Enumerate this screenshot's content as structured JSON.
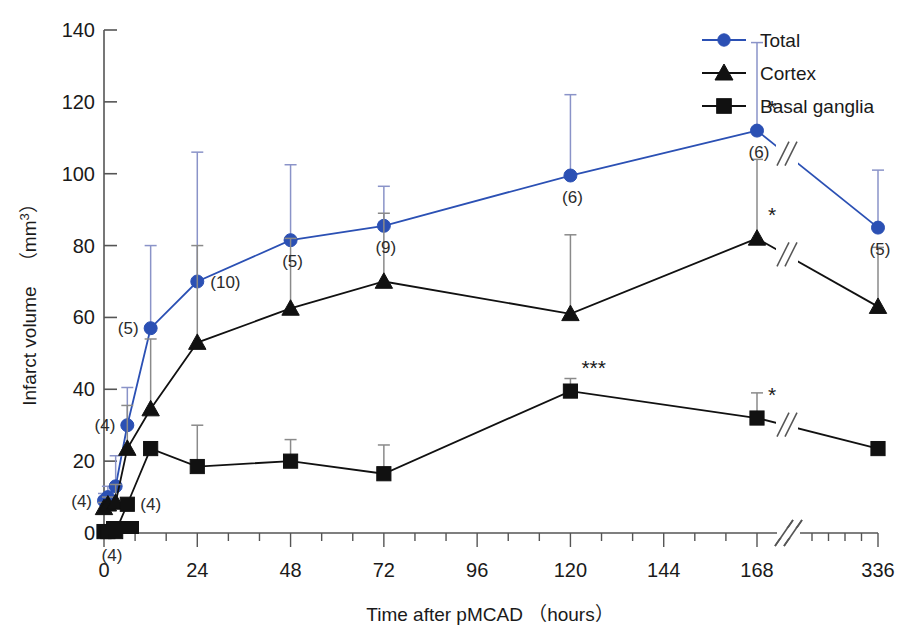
{
  "chart_data": {
    "type": "line",
    "title": "",
    "xlabel": "Time after pMCAD （hours）",
    "ylabel": "Infarct volume （mm3）",
    "ylabel_text": "Infarct volume",
    "ylabel_unit_prefix": "（mm",
    "ylabel_unit_sup": "3",
    "ylabel_unit_suffix": "）",
    "xlim": [
      0,
      336
    ],
    "ylim": [
      0,
      140
    ],
    "grid": false,
    "axis_break_x": true,
    "axis_break_between": [
      180,
      300
    ],
    "legend_position": "top-right",
    "x_ticks_major": [
      0,
      24,
      48,
      72,
      96,
      120,
      144,
      168,
      336
    ],
    "x_tick_labels": [
      "0",
      "24",
      "48",
      "72",
      "96",
      "120",
      "144",
      "168",
      "336"
    ],
    "x_ticks_minor": [
      8,
      16,
      32,
      40,
      56,
      64,
      80,
      88,
      104,
      112,
      128,
      136,
      152,
      160,
      312,
      288,
      264,
      240
    ],
    "y_ticks": [
      0,
      20,
      40,
      60,
      80,
      100,
      120,
      140
    ],
    "y_tick_labels": [
      "0",
      "20",
      "40",
      "60",
      "80",
      "100",
      "120",
      "140"
    ],
    "x": [
      0,
      1,
      3,
      6,
      12,
      24,
      48,
      72,
      120,
      168,
      336
    ],
    "series": [
      {
        "name": "Total",
        "color": "#2b50b4",
        "marker": "circle",
        "values": [
          9.0,
          10.0,
          13.0,
          30.0,
          57.0,
          70.0,
          81.5,
          85.5,
          99.5,
          112.0,
          85.0
        ],
        "err_up": [
          2.0,
          3.0,
          8.5,
          10.5,
          23.0,
          36.0,
          21.0,
          11.0,
          22.5,
          24.5,
          16.0
        ],
        "n_labels": [
          {
            "x": 0,
            "y": 9.0,
            "text": "(4)",
            "pos": "left"
          },
          {
            "x": 6,
            "y": 30.0,
            "text": "(4)",
            "pos": "left"
          },
          {
            "x": 12,
            "y": 57.0,
            "text": "(5)",
            "pos": "left"
          },
          {
            "x": 24,
            "y": 70.0,
            "text": "(10)",
            "pos": "right"
          },
          {
            "x": 48,
            "y": 81.5,
            "text": "(5)",
            "pos": "below"
          },
          {
            "x": 72,
            "y": 85.5,
            "text": "(9)",
            "pos": "below"
          },
          {
            "x": 120,
            "y": 99.5,
            "text": "(6)",
            "pos": "below"
          },
          {
            "x": 168,
            "y": 112.0,
            "text": "(6)",
            "pos": "below"
          },
          {
            "x": 336,
            "y": 85.0,
            "text": "(5)",
            "pos": "below"
          }
        ],
        "sig_marks": [
          {
            "x": 168,
            "y": 112.0,
            "text": "*"
          }
        ]
      },
      {
        "name": "Cortex",
        "color": "#111111",
        "marker": "triangle",
        "values": [
          7.0,
          8.0,
          8.5,
          23.5,
          34.5,
          53.0,
          62.5,
          70.0,
          61.0,
          82.0,
          63.0
        ],
        "err_up": [
          1.5,
          2.0,
          5.0,
          12.0,
          19.5,
          27.0,
          19.5,
          19.0,
          22.0,
          22.0,
          16.5
        ],
        "n_labels": [],
        "sig_marks": [
          {
            "x": 168,
            "y": 82.0,
            "text": "*"
          }
        ]
      },
      {
        "name": "Basal ganglia",
        "color": "#111111",
        "marker": "square",
        "values": [
          0.4,
          0.4,
          0.4,
          8.0,
          23.5,
          18.5,
          20.0,
          16.5,
          39.5,
          32.0,
          23.5
        ],
        "err_up": [
          0.0,
          0.0,
          0.0,
          0.0,
          0.0,
          11.5,
          6.0,
          8.0,
          3.5,
          7.0,
          0.0
        ],
        "n_labels": [
          {
            "x": 0,
            "y": 0.4,
            "text": "(4)",
            "pos": "bottom"
          },
          {
            "x": 6,
            "y": 8.0,
            "text": "(4)",
            "pos": "right"
          }
        ],
        "sig_marks": [
          {
            "x": 120,
            "y": 39.5,
            "text": "***"
          },
          {
            "x": 168,
            "y": 32.0,
            "text": "*"
          }
        ]
      }
    ],
    "legend": [
      {
        "label": "Total",
        "color": "#2b50b4",
        "marker": "circle"
      },
      {
        "label": "Cortex",
        "color": "#111111",
        "marker": "triangle"
      },
      {
        "label": "Basal ganglia",
        "color": "#111111",
        "marker": "square"
      }
    ]
  }
}
